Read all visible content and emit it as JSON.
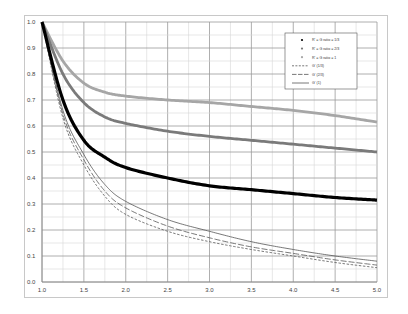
{
  "chart_data": {
    "type": "line",
    "title": "",
    "xlabel": "",
    "ylabel": "",
    "xlim": [
      1.0,
      5.0
    ],
    "ylim": [
      0.0,
      1.0
    ],
    "grid": true,
    "legend_position": "upper right (inside)",
    "x_ticks": [
      "1.0",
      "1.5",
      "2.0",
      "2.5",
      "3.0",
      "3.5",
      "4.0",
      "4.5",
      "5.0"
    ],
    "y_ticks": [
      "0.0",
      "0.1",
      "0.2",
      "0.3",
      "0.4",
      "0.5",
      "0.6",
      "0.7",
      "0.8",
      "0.9",
      "1.0"
    ],
    "x": [
      1.0,
      1.25,
      1.5,
      1.75,
      2.0,
      2.5,
      3.0,
      3.5,
      4.0,
      4.5,
      5.0
    ],
    "series": [
      {
        "name": "R' = G ratio = 1/3",
        "style": "markers",
        "color": "#000000",
        "values": [
          1.0,
          0.7,
          0.545,
          0.48,
          0.44,
          0.4,
          0.37,
          0.355,
          0.34,
          0.325,
          0.315
        ]
      },
      {
        "name": "R' = G ratio = 2/3",
        "style": "markers",
        "color": "#7a7a7a",
        "values": [
          1.0,
          0.8,
          0.69,
          0.635,
          0.61,
          0.58,
          0.56,
          0.545,
          0.53,
          0.515,
          0.5
        ]
      },
      {
        "name": "R' = G ratio = 1",
        "style": "markers",
        "color": "#a6a6a6",
        "values": [
          1.0,
          0.85,
          0.765,
          0.73,
          0.715,
          0.7,
          0.69,
          0.675,
          0.66,
          0.64,
          0.615
        ]
      },
      {
        "name": "G' (1/3)",
        "style": "short-dash",
        "color": "#555555",
        "values": [
          1.0,
          0.63,
          0.45,
          0.33,
          0.26,
          0.195,
          0.155,
          0.125,
          0.1,
          0.075,
          0.055
        ]
      },
      {
        "name": "G' (2/3)",
        "style": "long-dash",
        "color": "#555555",
        "values": [
          1.0,
          0.645,
          0.47,
          0.35,
          0.285,
          0.215,
          0.17,
          0.135,
          0.11,
          0.085,
          0.065
        ]
      },
      {
        "name": "G' (1)",
        "style": "solid",
        "color": "#555555",
        "values": [
          1.0,
          0.66,
          0.49,
          0.375,
          0.31,
          0.24,
          0.195,
          0.155,
          0.125,
          0.1,
          0.08
        ]
      }
    ]
  }
}
